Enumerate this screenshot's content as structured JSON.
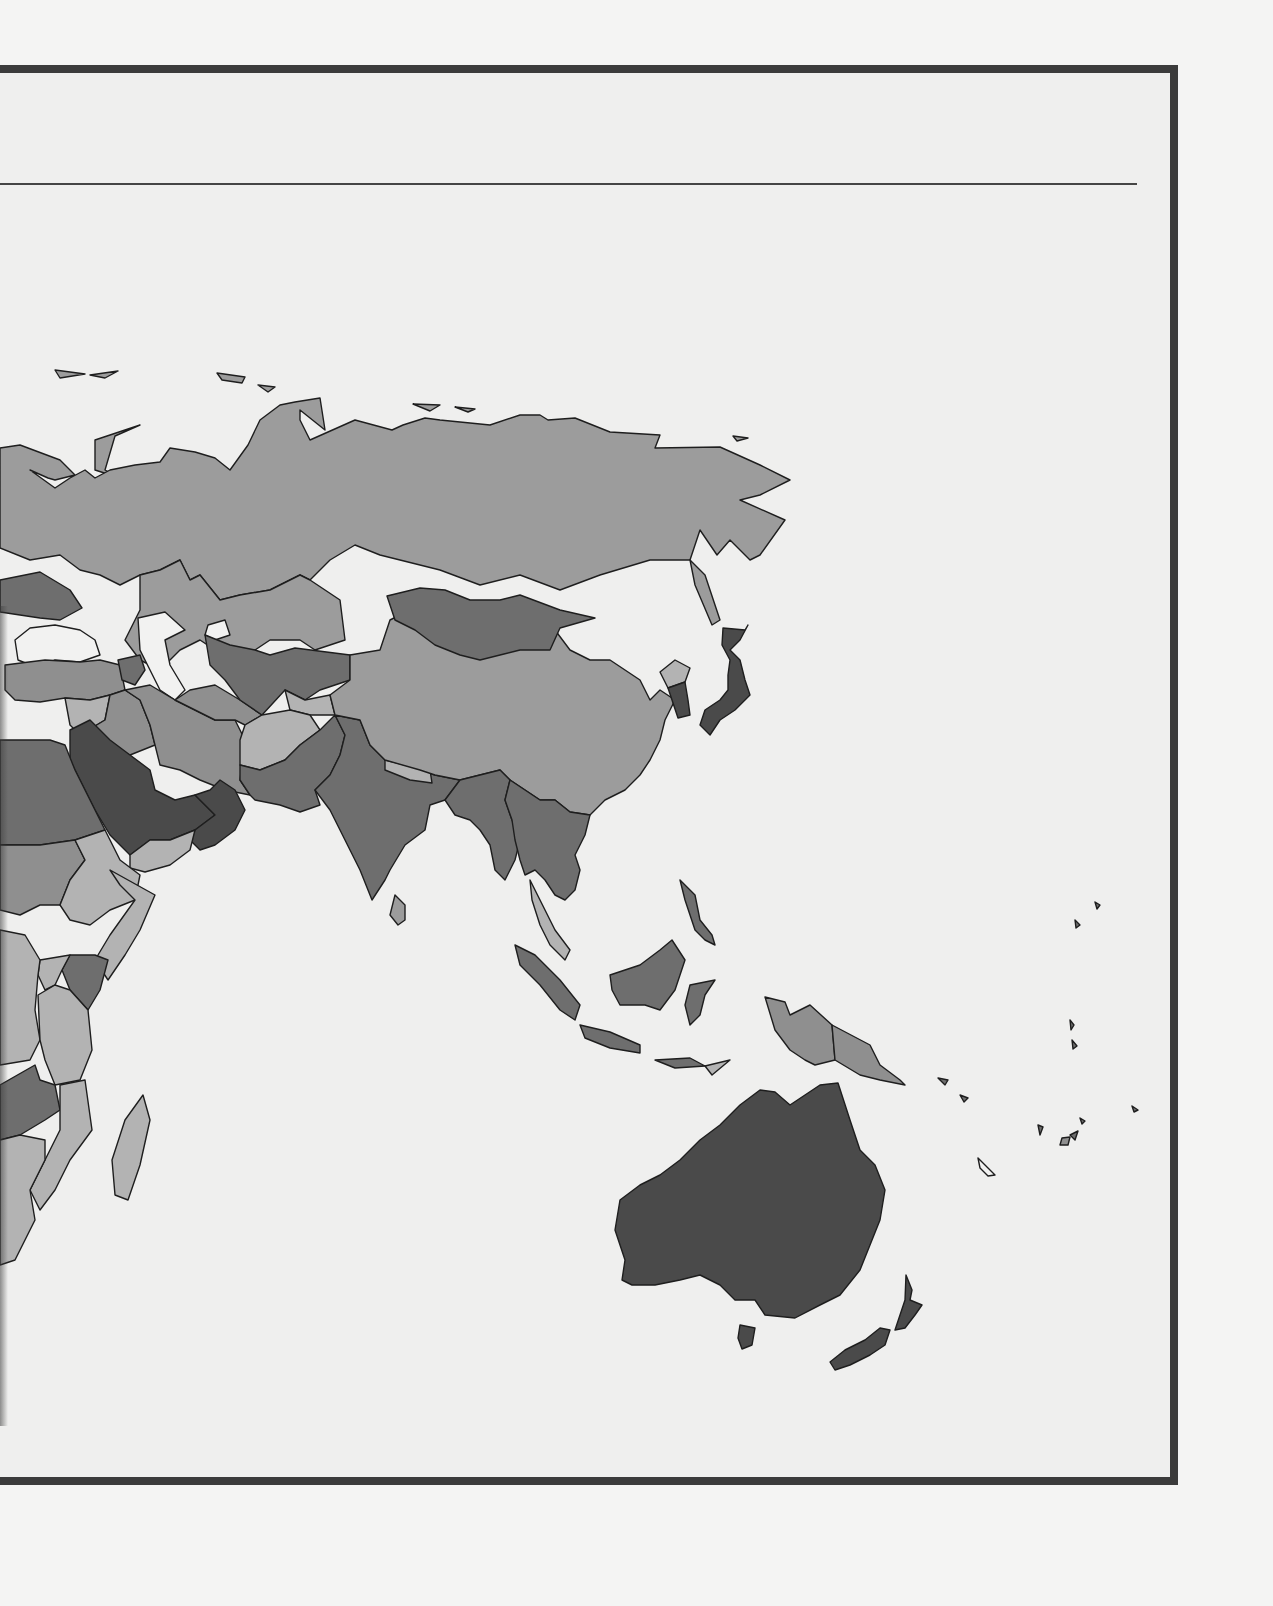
{
  "page": {
    "background": "#f4f4f3",
    "frame_fill": "#efefee",
    "frame_border": "#3b3b3b",
    "rule_color": "#454545",
    "caption_text": "",
    "bleed_through_text_legible": false
  },
  "map": {
    "type": "choropleth",
    "title": "",
    "legend": [],
    "region_shown": "Eurasia (east of Europe), Middle East, East Africa, South & Southeast Asia, Oceania",
    "shade_classes": {
      "water": "#f2f2f1",
      "lightest": "#b3b3b3",
      "light": "#9c9c9c",
      "medium": "#8f8f8f",
      "dark": "#6e6e6e",
      "darkest": "#4a4a4a"
    },
    "regions": [
      {
        "name": "Russia",
        "shade": "light"
      },
      {
        "name": "Kazakhstan",
        "shade": "light"
      },
      {
        "name": "China",
        "shade": "light"
      },
      {
        "name": "Mongolia",
        "shade": "dark"
      },
      {
        "name": "Ukraine",
        "shade": "dark"
      },
      {
        "name": "Turkey",
        "shade": "medium"
      },
      {
        "name": "Georgia/Armenia",
        "shade": "dark"
      },
      {
        "name": "Iran",
        "shade": "medium"
      },
      {
        "name": "Iraq",
        "shade": "medium"
      },
      {
        "name": "Syria",
        "shade": "lightest"
      },
      {
        "name": "Uzbekistan/Kyrgyzstan",
        "shade": "dark"
      },
      {
        "name": "Turkmenistan",
        "shade": "medium"
      },
      {
        "name": "Afghanistan",
        "shade": "lightest"
      },
      {
        "name": "Pakistan",
        "shade": "dark"
      },
      {
        "name": "India",
        "shade": "dark"
      },
      {
        "name": "Nepal",
        "shade": "lightest"
      },
      {
        "name": "Bangladesh/Myanmar",
        "shade": "dark"
      },
      {
        "name": "Saudi Arabia",
        "shade": "darkest"
      },
      {
        "name": "Oman/UAE",
        "shade": "darkest"
      },
      {
        "name": "Yemen",
        "shade": "lightest"
      },
      {
        "name": "Egypt/Sudan",
        "shade": "dark"
      },
      {
        "name": "Ethiopia",
        "shade": "lightest"
      },
      {
        "name": "Somalia",
        "shade": "lightest"
      },
      {
        "name": "Kenya",
        "shade": "dark"
      },
      {
        "name": "Tanzania",
        "shade": "lightest"
      },
      {
        "name": "Madagascar",
        "shade": "lightest"
      },
      {
        "name": "Mozambique",
        "shade": "lightest"
      },
      {
        "name": "Japan",
        "shade": "darkest"
      },
      {
        "name": "South Korea",
        "shade": "darkest"
      },
      {
        "name": "North Korea",
        "shade": "lightest"
      },
      {
        "name": "Southeast Asia mainland",
        "shade": "dark"
      },
      {
        "name": "Malaysia",
        "shade": "lightest"
      },
      {
        "name": "Indonesia",
        "shade": "dark"
      },
      {
        "name": "Philippines",
        "shade": "dark"
      },
      {
        "name": "Papua New Guinea",
        "shade": "medium"
      },
      {
        "name": "Sri Lanka",
        "shade": "light"
      },
      {
        "name": "Australia",
        "shade": "darkest"
      },
      {
        "name": "New Zealand",
        "shade": "darkest"
      },
      {
        "name": "Black Sea",
        "shade": "water"
      },
      {
        "name": "Caspian Sea",
        "shade": "water"
      },
      {
        "name": "Aral Sea",
        "shade": "water"
      }
    ]
  }
}
